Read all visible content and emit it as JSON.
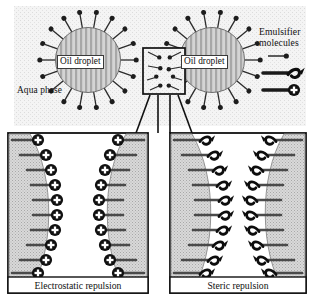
{
  "figure": {
    "background_color": "#ffffff",
    "width": 328,
    "height": 302
  },
  "top_section": {
    "name": "aqua-phase-region",
    "phase_label": "Aqua phase",
    "background_color": "#f2f2f2",
    "texture": "fine-stipple",
    "droplets": [
      {
        "label": "Oil droplet",
        "cx": 88,
        "cy": 60,
        "r": 33,
        "texture": "vertical-stripes",
        "fill_color": "#b9b9b9"
      },
      {
        "label": "Oil droplet",
        "cx": 212,
        "cy": 60,
        "r": 33,
        "texture": "vertical-stripes",
        "fill_color": "#b9b9b9"
      }
    ],
    "emulsifier_count_per_droplet": 18,
    "zoom_box": {
      "name": "magnified-region-box",
      "x": 143,
      "y": 48,
      "width": 42,
      "height": 46,
      "border_color": "#111111"
    }
  },
  "legend": {
    "title_line_1": "Emulsifier",
    "title_line_2": "molecules",
    "items": [
      {
        "icon": "thin-tail-head-icon",
        "description": "emulsifier molecule"
      },
      {
        "icon": "thick-tail-coil-icon",
        "description": "steric polymer chain"
      },
      {
        "icon": "thick-tail-plus-charge-icon",
        "description": "charged head group"
      }
    ]
  },
  "panels": [
    {
      "id": "electrostatic",
      "caption": "Electrostatic repulsion",
      "head_type": "plus-circle",
      "head_symbol": "+",
      "chain_rows": 10,
      "border_color": "#111111",
      "surface_fill": "#cfcfcf"
    },
    {
      "id": "steric",
      "caption": "Steric repulsion",
      "head_type": "coil-hook",
      "head_symbol": "",
      "chain_rows": 10,
      "border_color": "#111111",
      "surface_fill": "#cfcfcf"
    }
  ],
  "colors": {
    "ink": "#111111",
    "droplet_stripe_dark": "#9a9a9a",
    "droplet_stripe_light": "#d8d8d8",
    "aqua_background": "#f1f1f1",
    "panel_background": "#ffffff"
  }
}
